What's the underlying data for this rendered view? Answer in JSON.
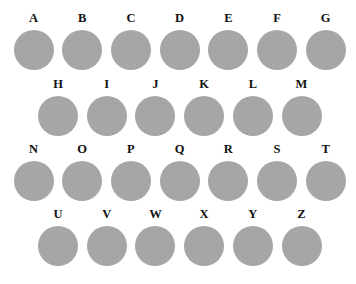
{
  "style": {
    "circle_color": "#a6a6a6",
    "label_color": "#111111",
    "background": "#ffffff"
  },
  "rows": [
    {
      "letters": [
        "A",
        "B",
        "C",
        "D",
        "E",
        "F",
        "G"
      ],
      "x0": 33.5,
      "label_y": 18,
      "circle_y": 49.5
    },
    {
      "letters": [
        "H",
        "I",
        "J",
        "K",
        "L",
        "M"
      ],
      "x0": 58,
      "label_y": 84,
      "circle_y": 116
    },
    {
      "letters": [
        "N",
        "O",
        "P",
        "Q",
        "R",
        "S",
        "T"
      ],
      "x0": 33.5,
      "label_y": 149,
      "circle_y": 180.5
    },
    {
      "letters": [
        "U",
        "V",
        "W",
        "X",
        "Y",
        "Z"
      ],
      "x0": 58,
      "label_y": 214,
      "circle_y": 245.5
    }
  ],
  "spacing": 48.7
}
